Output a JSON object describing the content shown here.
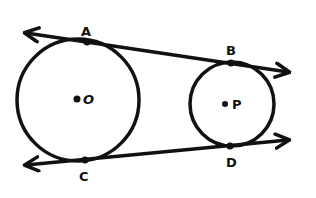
{
  "diagram": {
    "stroke_color": "#111111",
    "background_color": "#ffffff",
    "circles": [
      {
        "name": "O",
        "label": "O",
        "center": [
          78,
          100
        ],
        "radius": 61
      },
      {
        "name": "P",
        "label": "P",
        "center": [
          232,
          104
        ],
        "radius": 42
      }
    ],
    "points": [
      {
        "name": "A",
        "label": "A",
        "pos": [
          87,
          42
        ]
      },
      {
        "name": "B",
        "label": "B",
        "pos": [
          231,
          63
        ]
      },
      {
        "name": "C",
        "label": "C",
        "pos": [
          85,
          160
        ]
      },
      {
        "name": "D",
        "label": "D",
        "pos": [
          230,
          146
        ]
      }
    ],
    "lines": [
      {
        "name": "line-AB",
        "through": [
          "A",
          "B"
        ],
        "arrows": "both",
        "from": [
          22,
          32
        ],
        "to": [
          292,
          73
        ]
      },
      {
        "name": "line-CD",
        "through": [
          "C",
          "D"
        ],
        "arrows": "both",
        "from": [
          22,
          165
        ],
        "to": [
          292,
          139
        ]
      }
    ]
  }
}
